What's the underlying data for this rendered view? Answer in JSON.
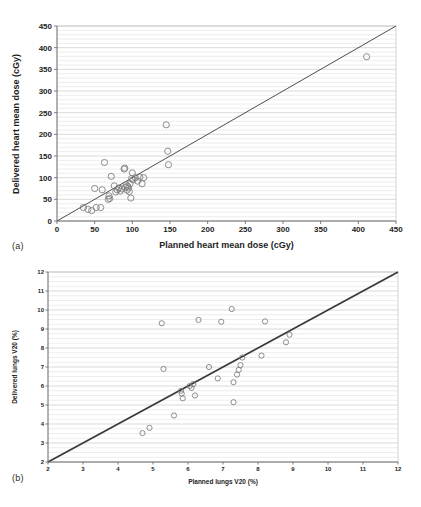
{
  "figure": {
    "panels": [
      {
        "id": "a",
        "label": "(a)"
      },
      {
        "id": "b",
        "label": "(b)"
      }
    ]
  },
  "chart_data": [
    {
      "panel": "a",
      "type": "scatter",
      "title": "",
      "xlabel": "Planned heart mean dose (cGy)",
      "ylabel": "Delivered heart mean dose (cGy)",
      "xlim": [
        0,
        450
      ],
      "ylim": [
        0,
        450
      ],
      "xticks": [
        0,
        50,
        100,
        150,
        200,
        250,
        300,
        350,
        400,
        450
      ],
      "yticks": [
        0,
        50,
        100,
        150,
        200,
        250,
        300,
        350,
        400,
        450
      ],
      "xtick_labels": [
        "0",
        "50",
        "100",
        "150",
        "200",
        "250",
        "300",
        "350",
        "400",
        "450"
      ],
      "ytick_labels": [
        "0",
        "50",
        "100",
        "150",
        "200",
        "250",
        "300",
        "350",
        "400",
        "450"
      ],
      "grid": "horizontal-minor",
      "legend": "none",
      "annotations": [
        "identity line y = x"
      ],
      "reference_line": {
        "type": "identity",
        "from": [
          0,
          0
        ],
        "to": [
          450,
          450
        ]
      },
      "marker_style": "open-circle",
      "points": [
        [
          35,
          31
        ],
        [
          41,
          27
        ],
        [
          46,
          24
        ],
        [
          50,
          75
        ],
        [
          52,
          31
        ],
        [
          58,
          31
        ],
        [
          60,
          72
        ],
        [
          63,
          135
        ],
        [
          68,
          50
        ],
        [
          69,
          58
        ],
        [
          70,
          52
        ],
        [
          72,
          103
        ],
        [
          76,
          81
        ],
        [
          78,
          67
        ],
        [
          80,
          72
        ],
        [
          82,
          76
        ],
        [
          84,
          69
        ],
        [
          86,
          74
        ],
        [
          89,
          120
        ],
        [
          90,
          122
        ],
        [
          91,
          78
        ],
        [
          92,
          83
        ],
        [
          93,
          71
        ],
        [
          94,
          80
        ],
        [
          95,
          76
        ],
        [
          96,
          68
        ],
        [
          97,
          86
        ],
        [
          98,
          53
        ],
        [
          99,
          98
        ],
        [
          100,
          111
        ],
        [
          101,
          95
        ],
        [
          104,
          100
        ],
        [
          107,
          92
        ],
        [
          110,
          101
        ],
        [
          113,
          86
        ],
        [
          115,
          100
        ],
        [
          145,
          222
        ],
        [
          147,
          161
        ],
        [
          148,
          130
        ],
        [
          411,
          379
        ]
      ]
    },
    {
      "panel": "b",
      "type": "scatter",
      "title": "",
      "xlabel": "Planned lungs V20 (%)",
      "ylabel": "Delivered lungs V20 (%)",
      "xlim": [
        2,
        12
      ],
      "ylim": [
        2,
        12
      ],
      "xticks": [
        2,
        3,
        4,
        5,
        6,
        7,
        8,
        9,
        10,
        11,
        12
      ],
      "yticks": [
        2,
        3,
        4,
        5,
        6,
        7,
        8,
        9,
        10,
        11,
        12
      ],
      "xtick_labels": [
        "2",
        "3",
        "4",
        "5",
        "6",
        "7",
        "8",
        "9",
        "10",
        "11",
        "12"
      ],
      "ytick_labels": [
        "2",
        "3",
        "4",
        "5",
        "6",
        "7",
        "8",
        "9",
        "10",
        "11",
        "12"
      ],
      "grid": "horizontal-minor",
      "legend": "none",
      "annotations": [
        "identity line y = x"
      ],
      "reference_line": {
        "type": "identity",
        "from": [
          2,
          2
        ],
        "to": [
          12,
          12
        ]
      },
      "marker_style": "open-circle",
      "points": [
        [
          4.7,
          3.52
        ],
        [
          4.9,
          3.8
        ],
        [
          5.25,
          9.3
        ],
        [
          5.3,
          6.9
        ],
        [
          5.6,
          4.45
        ],
        [
          5.8,
          5.75
        ],
        [
          5.82,
          5.6
        ],
        [
          5.85,
          5.35
        ],
        [
          6.05,
          6.0
        ],
        [
          6.1,
          5.9
        ],
        [
          6.15,
          6.1
        ],
        [
          6.2,
          5.5
        ],
        [
          6.3,
          9.48
        ],
        [
          6.6,
          7.0
        ],
        [
          6.85,
          6.4
        ],
        [
          6.95,
          9.38
        ],
        [
          7.25,
          10.05
        ],
        [
          7.3,
          6.2
        ],
        [
          7.3,
          5.15
        ],
        [
          7.4,
          6.6
        ],
        [
          7.45,
          6.85
        ],
        [
          7.5,
          7.1
        ],
        [
          7.55,
          7.5
        ],
        [
          8.1,
          7.6
        ],
        [
          8.2,
          9.4
        ],
        [
          8.8,
          8.3
        ],
        [
          8.9,
          8.7
        ]
      ]
    }
  ]
}
